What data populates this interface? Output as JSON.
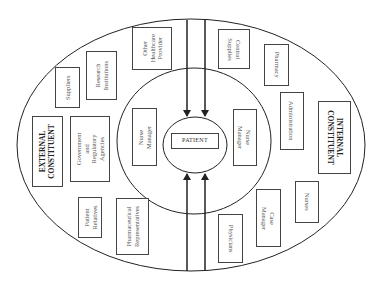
{
  "diagram": {
    "colors": {
      "line": "#222222",
      "box_border": "#444444",
      "text": "#555555",
      "background": "#ffffff"
    },
    "center": {
      "label": "PATIENT"
    },
    "rings": [
      {
        "name": "outer-ring",
        "cx": 191,
        "cy": 145,
        "rx": 174,
        "ry": 126
      },
      {
        "name": "middle-ring",
        "cx": 194,
        "cy": 141,
        "rx": 77,
        "ry": 73
      },
      {
        "name": "inner-ring",
        "cx": 195,
        "cy": 145,
        "rx": 32,
        "ry": 28
      }
    ],
    "arrows": [
      {
        "name": "arrow-top-left",
        "x": 187,
        "y1": 20,
        "y2": 115,
        "direction": "down"
      },
      {
        "name": "arrow-top-right",
        "x": 205,
        "y1": 20,
        "y2": 115,
        "direction": "down"
      },
      {
        "name": "arrow-bottom-left",
        "x": 187,
        "y1": 271,
        "y2": 174,
        "direction": "up"
      },
      {
        "name": "arrow-bottom-right",
        "x": 205,
        "y1": 271,
        "y2": 174,
        "direction": "up"
      }
    ],
    "external_constituent": {
      "title": "EXTERNAL\nCONSTITUENT",
      "members": [
        "Suppliers",
        "Research\nInstitutions",
        "Other\nHealthcare\nProvider",
        "Government and\nRegulatory\nAgencies",
        "Patient\nRelatives",
        "Pharmaceutical\nRepresentatives"
      ]
    },
    "internal_constituent": {
      "title": "INTERNAL\nCONSTITUENT",
      "members": [
        "Central\nSupplies",
        "Pharmacy",
        "Administration",
        "Nurses",
        "Case Manager",
        "Physicians"
      ]
    },
    "middle_ring_labels": {
      "left": "Nurse Manager",
      "right": "Nurse Manager"
    }
  }
}
